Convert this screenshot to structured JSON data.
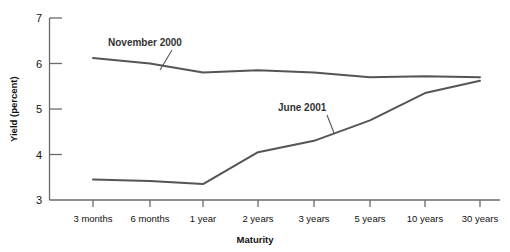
{
  "chart_data": {
    "type": "line",
    "title": "",
    "xlabel": "Maturity",
    "ylabel": "Yield (percent)",
    "categories": [
      "3 months",
      "6 months",
      "1 year",
      "2 years",
      "3 years",
      "5 years",
      "10 years",
      "30 years"
    ],
    "ylim": [
      3,
      7
    ],
    "yticks": [
      3,
      4,
      5,
      6,
      7
    ],
    "ytick_labels": [
      "3",
      "4",
      "5",
      "6",
      "7"
    ],
    "grid": false,
    "legend_position": "inline-annotations",
    "series": [
      {
        "name": "November 2000",
        "color": "#555555",
        "values": [
          6.12,
          6.0,
          5.8,
          5.85,
          5.8,
          5.7,
          5.72,
          5.7
        ]
      },
      {
        "name": "June 2001",
        "color": "#555555",
        "values": [
          3.45,
          3.42,
          3.35,
          4.05,
          4.3,
          4.75,
          5.35,
          5.62
        ]
      }
    ],
    "annotations": [
      {
        "text": "November 2000",
        "series": "November 2000"
      },
      {
        "text": "June 2001",
        "series": "June 2001"
      }
    ]
  },
  "axis": {
    "ylabel": "Yield (percent)",
    "xlabel": "Maturity"
  }
}
